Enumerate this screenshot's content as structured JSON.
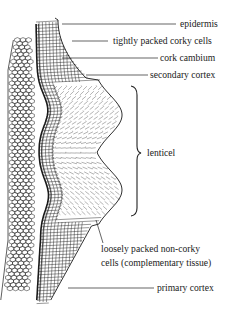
{
  "diagram": {
    "ink_color": "#1a1a1a",
    "background_color": "#ffffff",
    "labels": {
      "epidermis": "epidermis",
      "corky_cells": "tightly packed corky cells",
      "cork_cambium": "cork cambium",
      "secondary_cortex": "secondary cortex",
      "lenticel": "lenticel",
      "complementary_line1": "loosely packed non-corky",
      "complementary_line2": "cells (complementary tissue)",
      "primary_cortex": "primary cortex"
    },
    "tissues": [
      {
        "id": "primary-cortex",
        "pattern": "hexagonal cells"
      },
      {
        "id": "cork-cambium",
        "pattern": "thick dark line"
      },
      {
        "id": "corky-cells",
        "pattern": "dense rectangular grid"
      },
      {
        "id": "complementary-tissue",
        "pattern": "loose broken grid"
      }
    ]
  }
}
